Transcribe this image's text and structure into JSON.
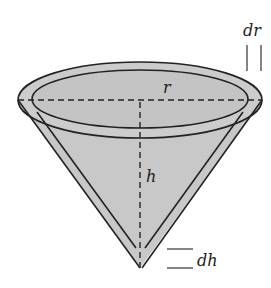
{
  "diagram": {
    "labels": {
      "radius": "r",
      "height": "h",
      "radius_increment": "dr",
      "height_increment": "dh"
    },
    "colors": {
      "fill": "#c8c8c8",
      "stroke": "#222222",
      "background": "#ffffff"
    }
  }
}
